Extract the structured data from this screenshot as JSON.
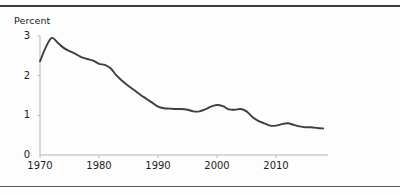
{
  "figure": {
    "background_color": "#fdfdfd",
    "rule_color": "#3a3a3a",
    "line_color": "#3f3f3f",
    "axis_color": "#b0b0b0"
  },
  "chart_data": {
    "type": "line",
    "title": "",
    "subtitle": "",
    "xlabel": "",
    "ylabel": "Percent",
    "ylabel_position": "above-axis",
    "grid": false,
    "legend": false,
    "xlim": [
      1970,
      2018
    ],
    "ylim": [
      0,
      3
    ],
    "yticks": [
      0,
      1,
      2,
      3
    ],
    "ytick_labels": [
      "0",
      "1",
      "2",
      "3"
    ],
    "xticks": [
      1970,
      1980,
      1990,
      2000,
      2010
    ],
    "xtick_labels": [
      "1970",
      "1980",
      "1990",
      "2000",
      "2010"
    ],
    "x": [
      1970,
      1971,
      1972,
      1973,
      1974,
      1975,
      1976,
      1977,
      1978,
      1979,
      1980,
      1981,
      1982,
      1983,
      1984,
      1985,
      1986,
      1987,
      1988,
      1989,
      1990,
      1991,
      1992,
      1993,
      1994,
      1995,
      1996,
      1997,
      1998,
      1999,
      2000,
      2001,
      2002,
      2003,
      2004,
      2005,
      2006,
      2007,
      2008,
      2009,
      2010,
      2011,
      2012,
      2013,
      2014,
      2015,
      2016,
      2017,
      2018
    ],
    "values": [
      2.36,
      2.72,
      2.95,
      2.83,
      2.7,
      2.62,
      2.55,
      2.47,
      2.42,
      2.38,
      2.3,
      2.27,
      2.18,
      2.0,
      1.86,
      1.74,
      1.63,
      1.52,
      1.42,
      1.32,
      1.22,
      1.18,
      1.17,
      1.16,
      1.16,
      1.14,
      1.1,
      1.1,
      1.15,
      1.22,
      1.26,
      1.23,
      1.15,
      1.14,
      1.16,
      1.1,
      0.96,
      0.86,
      0.8,
      0.74,
      0.74,
      0.78,
      0.8,
      0.76,
      0.72,
      0.7,
      0.7,
      0.68,
      0.67
    ],
    "series": [
      {
        "name": "Percent",
        "values": [
          2.36,
          2.72,
          2.95,
          2.83,
          2.7,
          2.62,
          2.55,
          2.47,
          2.42,
          2.38,
          2.3,
          2.27,
          2.18,
          2.0,
          1.86,
          1.74,
          1.63,
          1.52,
          1.42,
          1.32,
          1.22,
          1.18,
          1.17,
          1.16,
          1.16,
          1.14,
          1.1,
          1.1,
          1.15,
          1.22,
          1.26,
          1.23,
          1.15,
          1.14,
          1.16,
          1.1,
          0.96,
          0.86,
          0.8,
          0.74,
          0.74,
          0.78,
          0.8,
          0.76,
          0.72,
          0.7,
          0.7,
          0.68,
          0.67
        ]
      }
    ]
  }
}
